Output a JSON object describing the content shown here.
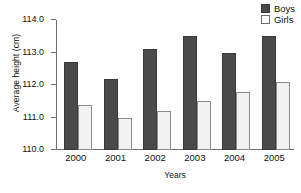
{
  "chart_data": {
    "type": "bar",
    "title": "",
    "xlabel": "Years",
    "ylabel": "Average height (cm)",
    "categories": [
      "2000",
      "2001",
      "2002",
      "2003",
      "2004",
      "2005"
    ],
    "series": [
      {
        "name": "Boys",
        "color": "#4a4a4a",
        "values": [
          112.7,
          112.2,
          113.1,
          113.5,
          113.0,
          113.5
        ]
      },
      {
        "name": "Girls",
        "color": "#f2f2f2",
        "values": [
          111.4,
          111.0,
          111.2,
          111.5,
          111.8,
          112.1
        ]
      }
    ],
    "ylim": [
      110.0,
      114.0
    ],
    "ytick_step": 1.0,
    "ytick_labels": [
      "110.0",
      "111.0",
      "112.0",
      "113.0",
      "114.0"
    ],
    "ytick_values": [
      110.0,
      111.0,
      112.0,
      113.0,
      114.0
    ],
    "grid": false,
    "legend_position": "top-right"
  },
  "legend": {
    "entries": [
      {
        "label": "Boys",
        "swatch": "filled-dark-square"
      },
      {
        "label": "Girls",
        "swatch": "outlined-white-square"
      }
    ]
  }
}
